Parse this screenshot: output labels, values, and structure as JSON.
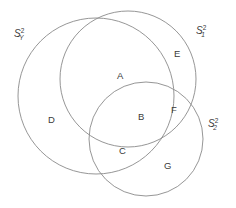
{
  "figure": {
    "type": "venn-diagram",
    "background_color": "#ffffff",
    "stroke_color": "#8a8a8a",
    "text_color": "#3a3a3a",
    "width": 236,
    "height": 208
  },
  "sets": [
    {
      "id": "s-y",
      "name": "S_Y^2",
      "base": "S",
      "superscript": "2",
      "subscript": "Y",
      "label_x": 14,
      "label_y": 28,
      "cx": 96,
      "cy": 96,
      "r": 78
    },
    {
      "id": "s-1",
      "name": "S_1^2",
      "base": "S",
      "superscript": "2",
      "subscript": "1",
      "label_x": 196,
      "label_y": 25,
      "cx": 128,
      "cy": 79,
      "r": 68
    },
    {
      "id": "s-2",
      "name": "S_2^2",
      "base": "S",
      "superscript": "2",
      "subscript": "2",
      "label_x": 208,
      "label_y": 118,
      "cx": 146,
      "cy": 139,
      "r": 57
    }
  ],
  "regions": [
    {
      "id": "a",
      "label": "A",
      "x": 117,
      "y": 71,
      "belongs_to": [
        "S_Y^2",
        "S_1^2"
      ]
    },
    {
      "id": "e",
      "label": "E",
      "x": 174,
      "y": 49,
      "belongs_to": [
        "S_1^2"
      ]
    },
    {
      "id": "d",
      "label": "D",
      "x": 48,
      "y": 115,
      "belongs_to": [
        "S_Y^2"
      ]
    },
    {
      "id": "b",
      "label": "B",
      "x": 138,
      "y": 112,
      "belongs_to": [
        "S_Y^2",
        "S_1^2",
        "S_2^2"
      ]
    },
    {
      "id": "f",
      "label": "F",
      "x": 171,
      "y": 105,
      "belongs_to": [
        "S_1^2",
        "S_2^2"
      ]
    },
    {
      "id": "c",
      "label": "C",
      "x": 119,
      "y": 146,
      "belongs_to": [
        "S_Y^2",
        "S_2^2"
      ]
    },
    {
      "id": "g",
      "label": "G",
      "x": 164,
      "y": 161,
      "belongs_to": [
        "S_2^2"
      ]
    }
  ]
}
